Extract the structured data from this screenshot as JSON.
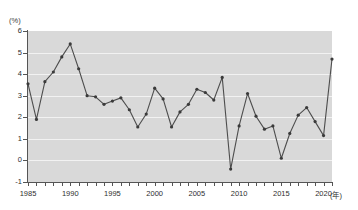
{
  "chart_data": {
    "type": "line",
    "title": "",
    "xlabel": "(年)",
    "ylabel": "(%)",
    "ylim": [
      -1,
      6
    ],
    "xlim": [
      1985,
      2021
    ],
    "grid": true,
    "legend": "none",
    "y_unit_label": "(%)",
    "x_unit_label": "(年)",
    "y_ticks": [
      6,
      5,
      4,
      3,
      2,
      1,
      0,
      -1
    ],
    "y_tick_labels": [
      "6",
      "5",
      "4",
      "3",
      "2",
      "1",
      "0",
      "-1"
    ],
    "x_ticks": [
      1985,
      1990,
      1995,
      2000,
      2005,
      2010,
      2015,
      2020
    ],
    "x_tick_labels": [
      "1985",
      "1990",
      "1995",
      "2000",
      "2005",
      "2010",
      "2015",
      "2020"
    ],
    "x_minor_ticks_every": 1,
    "marker": "circle",
    "x": [
      1985,
      1986,
      1987,
      1988,
      1989,
      1990,
      1991,
      1992,
      1993,
      1994,
      1995,
      1996,
      1997,
      1998,
      1999,
      2000,
      2001,
      2002,
      2003,
      2004,
      2005,
      2006,
      2007,
      2008,
      2009,
      2010,
      2011,
      2012,
      2013,
      2014,
      2015,
      2016,
      2017,
      2018,
      2019,
      2020,
      2021
    ],
    "values": [
      3.55,
      1.9,
      3.65,
      4.1,
      4.8,
      5.4,
      4.25,
      3.0,
      2.95,
      2.6,
      2.75,
      2.9,
      2.35,
      1.55,
      2.15,
      3.35,
      2.85,
      1.55,
      2.25,
      2.6,
      3.3,
      3.15,
      2.8,
      3.85,
      -0.4,
      1.6,
      3.1,
      2.05,
      1.45,
      1.6,
      0.1,
      1.25,
      2.1,
      2.45,
      1.8,
      1.15,
      4.7
    ],
    "series": [
      {
        "name": "",
        "color": "#4d4d4d",
        "values": [
          3.55,
          1.9,
          3.65,
          4.1,
          4.8,
          5.4,
          4.25,
          3.0,
          2.95,
          2.6,
          2.75,
          2.9,
          2.35,
          1.55,
          2.15,
          3.35,
          2.85,
          1.55,
          2.25,
          2.6,
          3.3,
          3.15,
          2.8,
          3.85,
          -0.4,
          1.6,
          3.1,
          2.05,
          1.45,
          1.6,
          0.1,
          1.25,
          2.1,
          2.45,
          1.8,
          1.15,
          4.7
        ]
      }
    ]
  },
  "style": {
    "plot_background": "#d9d9d9",
    "gridline_color": "#f2f2f2",
    "axis_color": "#555555",
    "line_color": "#4d4d4d",
    "marker_color": "#3a3a3a",
    "text_color": "#2e2e2e",
    "page_background": "#ffffff"
  }
}
